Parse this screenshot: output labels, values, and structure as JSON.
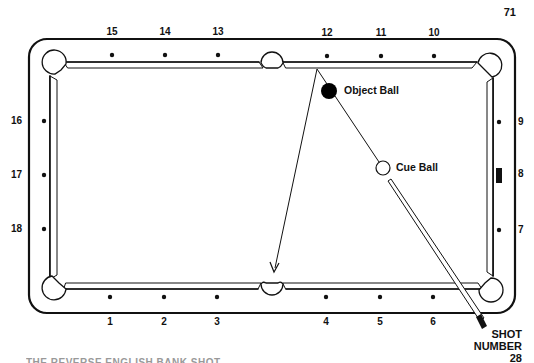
{
  "page": {
    "number": "71",
    "footer_text_partial": "THE REVERSE ENGLISH BANK SHOT"
  },
  "table": {
    "diamonds_top": [
      "15",
      "14",
      "13",
      "12",
      "11",
      "10"
    ],
    "diamonds_bottom": [
      "1",
      "2",
      "3",
      "4",
      "5",
      "6"
    ],
    "diamonds_left": [
      "16",
      "17",
      "18"
    ],
    "diamonds_right": [
      "9",
      "8",
      "7"
    ]
  },
  "balls": {
    "object_ball": {
      "label": "Object Ball",
      "color": "#000000"
    },
    "cue_ball": {
      "label": "Cue Ball",
      "color": "#ffffff"
    }
  },
  "shot": {
    "line1": "SHOT",
    "line2": "NUMBER",
    "number": "28"
  },
  "colors": {
    "ink": "#111111",
    "background": "#ffffff"
  }
}
